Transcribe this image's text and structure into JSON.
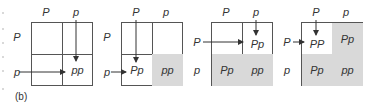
{
  "caption": "(b)",
  "colors": {
    "shaded": "#d9d9d9",
    "line": "#555555",
    "text": "#333333"
  },
  "panels": [
    {
      "col_labels": [
        "P",
        "p"
      ],
      "row_labels": [
        "P",
        "p"
      ],
      "cells": [
        [
          "",
          ""
        ],
        [
          "",
          "pp"
        ]
      ],
      "shaded": [
        [
          false,
          false
        ],
        [
          false,
          false
        ]
      ],
      "arrows": [
        {
          "from": "col-p-label",
          "to": "cell-1-1",
          "direction": "down"
        },
        {
          "from": "row-p-label",
          "to": "cell-1-1",
          "direction": "right"
        }
      ]
    },
    {
      "col_labels": [
        "P",
        "p"
      ],
      "row_labels": [
        "P",
        "p"
      ],
      "cells": [
        [
          "",
          ""
        ],
        [
          "Pp",
          "pp"
        ]
      ],
      "shaded": [
        [
          false,
          false
        ],
        [
          false,
          true
        ]
      ],
      "arrows": [
        {
          "from": "col-P-label",
          "to": "cell-1-0",
          "direction": "down"
        },
        {
          "from": "row-p-label",
          "to": "cell-1-0",
          "direction": "right"
        }
      ]
    },
    {
      "col_labels": [
        "P",
        "p"
      ],
      "row_labels": [
        "P",
        "p"
      ],
      "cells": [
        [
          "",
          "Pp"
        ],
        [
          "Pp",
          "pp"
        ]
      ],
      "shaded": [
        [
          false,
          false
        ],
        [
          true,
          true
        ]
      ],
      "arrows": [
        {
          "from": "col-p-label",
          "to": "cell-0-1",
          "direction": "down"
        },
        {
          "from": "row-P-label",
          "to": "cell-0-1",
          "direction": "right"
        }
      ]
    },
    {
      "col_labels": [
        "P",
        "p"
      ],
      "row_labels": [
        "P",
        "p"
      ],
      "cells": [
        [
          "PP",
          "Pp"
        ],
        [
          "Pp",
          "pp"
        ]
      ],
      "shaded": [
        [
          false,
          true
        ],
        [
          true,
          true
        ]
      ],
      "arrows": [
        {
          "from": "col-P-label",
          "to": "cell-0-0",
          "direction": "down"
        },
        {
          "from": "row-P-label",
          "to": "cell-0-0",
          "direction": "right"
        }
      ]
    }
  ]
}
